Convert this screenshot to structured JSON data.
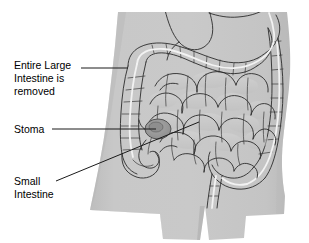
{
  "figure": {
    "background_color": "#ffffff",
    "body_fill_color": "#c6c6c6",
    "body_shadow_color": "#b4b4b4",
    "organ_stroke_color": "#2b2b2b",
    "removal_marker_color": "#f2f2f2",
    "stoma_color": "#9a9a9a",
    "label_color": "#000000",
    "leader_color": "#1a1a1a"
  },
  "labels": [
    {
      "id": "large-intestine",
      "lines": [
        "Entire Large",
        "Intestine is",
        "removed"
      ],
      "x": 14,
      "y": 69,
      "line_height": 13,
      "leader": {
        "x1": 81,
        "y1": 68,
        "x2": 128,
        "y2": 68
      }
    },
    {
      "id": "stoma",
      "lines": [
        "Stoma"
      ],
      "x": 14,
      "y": 133,
      "line_height": 13,
      "leader": {
        "x1": 52,
        "y1": 129,
        "x2": 156,
        "y2": 129
      }
    },
    {
      "id": "small-intestine",
      "lines": [
        "Small",
        "Intestine"
      ],
      "x": 14,
      "y": 185,
      "line_height": 13,
      "leader": {
        "x1": 56,
        "y1": 181,
        "x2": 199,
        "y2": 122
      }
    }
  ]
}
